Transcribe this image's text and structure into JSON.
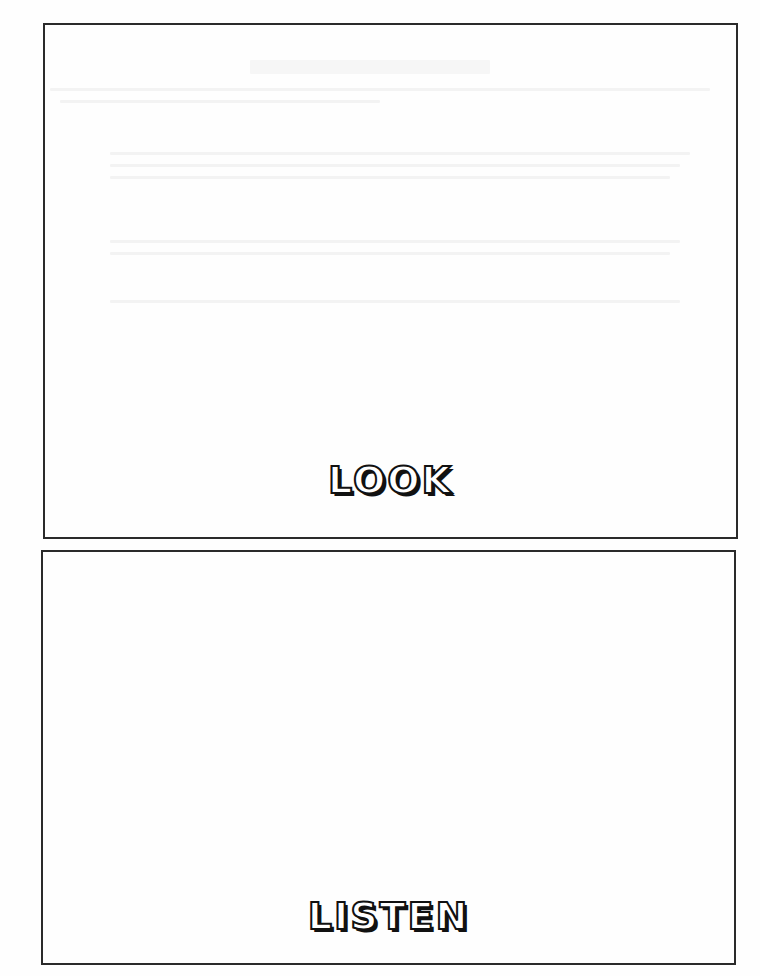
{
  "worksheet": {
    "panels": [
      {
        "label": "LOOK"
      },
      {
        "label": "LISTEN"
      }
    ]
  }
}
